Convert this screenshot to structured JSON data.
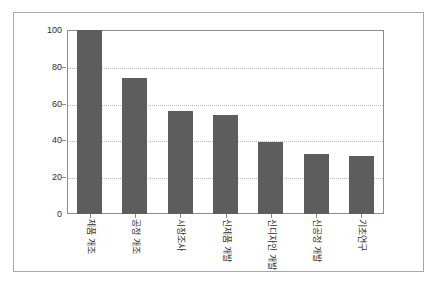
{
  "chart_data": {
    "type": "bar",
    "title": "",
    "subtitle": "",
    "xlabel": "",
    "ylabel": "",
    "categories": [
      "제품 개조",
      "공정 개조",
      "시장조사",
      "신제품 개발",
      "신디자인 개발",
      "신공정 개발",
      "기초연구"
    ],
    "values": [
      100,
      74,
      56,
      54,
      39,
      32.5,
      31.5
    ],
    "ylim": [
      0,
      100
    ],
    "yticks": [
      0,
      20,
      40,
      60,
      80,
      100
    ],
    "ytick_labels": [
      "0",
      "20",
      "40",
      "60",
      "80",
      "100"
    ],
    "grid": true,
    "grid_axis": "y",
    "grid_style": "dotted",
    "legend": false,
    "legend_position": "none",
    "bar_color": "#5d5d5d",
    "axis_color": "#8c8c8c",
    "gridline_color": "#b9b9b9",
    "frame_color": "#a8a8a8",
    "background_color": "#ffffff",
    "label_rotation": 90
  }
}
